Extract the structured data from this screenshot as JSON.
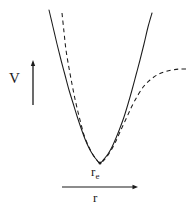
{
  "figure": {
    "background_color": "#ffffff",
    "ink_color": "#1b1b1b",
    "width": 190,
    "height": 210
  },
  "labels": {
    "vertical_axis": "V",
    "horizontal_axis": "r",
    "minimum_symbol": "r",
    "minimum_subscript": "e"
  },
  "chart_data": {
    "type": "line",
    "title": "",
    "xlabel": "r",
    "ylabel": "V",
    "grid": false,
    "legend": null,
    "axes": {
      "vertical_arrow": {
        "x": 33,
        "y_top": 60,
        "y_bottom": 105,
        "direction": "up",
        "label": "V"
      },
      "horizontal_arrow": {
        "y": 187,
        "x_start": 62,
        "x_end": 138,
        "direction": "right",
        "label": "r"
      }
    },
    "annotations": [
      {
        "text": "re",
        "display": "r_e",
        "meaning": "equilibrium internuclear distance",
        "x": 100,
        "y": 172
      }
    ],
    "minimum": {
      "x": 100,
      "y": 163
    },
    "series": [
      {
        "name": "harmonic-parabola",
        "style": "solid",
        "points": [
          [
            49,
            10
          ],
          [
            53,
            27
          ],
          [
            57,
            44
          ],
          [
            61,
            60
          ],
          [
            65,
            75
          ],
          [
            69,
            90
          ],
          [
            73,
            103
          ],
          [
            77,
            116
          ],
          [
            81,
            128
          ],
          [
            85,
            139
          ],
          [
            89,
            148
          ],
          [
            93,
            155
          ],
          [
            96,
            159
          ],
          [
            100,
            163
          ],
          [
            104,
            159
          ],
          [
            108,
            154
          ],
          [
            112,
            147
          ],
          [
            116,
            138
          ],
          [
            120,
            128
          ],
          [
            124,
            117
          ],
          [
            128,
            104
          ],
          [
            132,
            90
          ],
          [
            136,
            75
          ],
          [
            140,
            60
          ],
          [
            144,
            44
          ],
          [
            148,
            27
          ],
          [
            152,
            13
          ]
        ]
      },
      {
        "name": "morse-potential",
        "style": "dashed",
        "points": [
          [
            62,
            13
          ],
          [
            64,
            32
          ],
          [
            66,
            50
          ],
          [
            69,
            68
          ],
          [
            72,
            84
          ],
          [
            75,
            99
          ],
          [
            78,
            112
          ],
          [
            81,
            124
          ],
          [
            84,
            135
          ],
          [
            88,
            145
          ],
          [
            92,
            153
          ],
          [
            96,
            159
          ],
          [
            100,
            163
          ],
          [
            105,
            159
          ],
          [
            110,
            152
          ],
          [
            115,
            143
          ],
          [
            120,
            132
          ],
          [
            126,
            119
          ],
          [
            132,
            106
          ],
          [
            138,
            95
          ],
          [
            144,
            86
          ],
          [
            150,
            80
          ],
          [
            157,
            75
          ],
          [
            164,
            72
          ],
          [
            172,
            70
          ],
          [
            180,
            69
          ],
          [
            187,
            69
          ]
        ]
      }
    ]
  }
}
